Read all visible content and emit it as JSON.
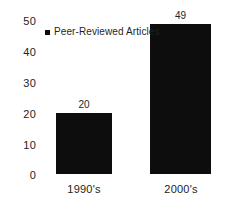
{
  "chart_data": {
    "type": "bar",
    "title": "",
    "subtitle": "",
    "xlabel": "",
    "ylabel": "",
    "categories": [
      "1990's",
      "2000's"
    ],
    "values": [
      20,
      49
    ],
    "data_labels": [
      "20",
      "49"
    ],
    "series": [
      {
        "name": "Peer-Reviewed Articles",
        "values": [
          20,
          49
        ],
        "color": "#0d0d0d"
      }
    ],
    "ylim": [
      0,
      50
    ],
    "yticks": [
      0,
      10,
      20,
      30,
      40,
      50
    ],
    "ytick_labels": [
      "0",
      "10",
      "20",
      "30",
      "40",
      "50"
    ],
    "grid": false,
    "axis_line": false,
    "tick_marks": false,
    "legend": {
      "position": "top-left-inside",
      "entries": [
        {
          "label": "Peer-Reviewed Articles",
          "color": "#0d0d0d",
          "marker": "square"
        }
      ]
    },
    "background_color": "#ffffff",
    "text_color": "#232323"
  }
}
